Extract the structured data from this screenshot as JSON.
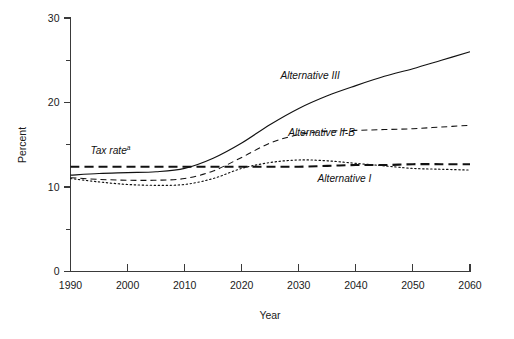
{
  "chart_data": {
    "type": "line",
    "title": "",
    "xlabel": "Year",
    "ylabel": "Percent",
    "xlim": [
      1990,
      2060
    ],
    "ylim": [
      0,
      30
    ],
    "grid": false,
    "legend_position": "inline-annotations",
    "x_ticks": [
      1990,
      2000,
      2010,
      2020,
      2030,
      2040,
      2050,
      2060
    ],
    "x_tick_labels": [
      "1990",
      "2000",
      "2010",
      "2020",
      "2030",
      "2040",
      "2050",
      "2060"
    ],
    "y_ticks": [
      0,
      10,
      20,
      30
    ],
    "y_tick_labels": [
      "0",
      "10",
      "20",
      "30"
    ],
    "y_minor_ticks": [
      5,
      15,
      25
    ],
    "x": [
      1990,
      1995,
      2000,
      2005,
      2010,
      2015,
      2020,
      2025,
      2030,
      2035,
      2040,
      2045,
      2050,
      2055,
      2060
    ],
    "series": [
      {
        "name": "Alternative III",
        "style": "solid",
        "label": "Alternative III",
        "label_x": 2032,
        "label_y": 22.8,
        "values": [
          11.4,
          11.6,
          11.7,
          11.8,
          12.2,
          13.4,
          15.2,
          17.4,
          19.3,
          20.8,
          22.0,
          23.1,
          24.0,
          25.0,
          26.0
        ]
      },
      {
        "name": "Alternative II-B",
        "style": "dashed",
        "label": "Alternative II-B",
        "label_x": 2034,
        "label_y": 16.0,
        "values": [
          11.1,
          10.9,
          10.8,
          10.8,
          11.0,
          11.9,
          13.5,
          15.2,
          16.2,
          16.6,
          16.7,
          16.8,
          16.9,
          17.1,
          17.3
        ]
      },
      {
        "name": "Alternative I",
        "style": "dotted",
        "label": "Alternative I",
        "label_x": 2038,
        "label_y": 10.6,
        "values": [
          11.0,
          10.6,
          10.3,
          10.2,
          10.3,
          11.0,
          12.2,
          12.9,
          13.2,
          13.1,
          12.8,
          12.5,
          12.2,
          12.1,
          12.0
        ]
      },
      {
        "name": "Tax rate",
        "style": "heavy-dashed",
        "label": "Tax rate",
        "label_superscript": "a",
        "label_x": 1997,
        "label_y": 13.9,
        "values": [
          12.4,
          12.4,
          12.4,
          12.4,
          12.4,
          12.4,
          12.4,
          12.4,
          12.4,
          12.5,
          12.6,
          12.6,
          12.7,
          12.7,
          12.7
        ]
      }
    ]
  },
  "axes": {
    "y_label": "Percent",
    "x_label": "Year"
  }
}
